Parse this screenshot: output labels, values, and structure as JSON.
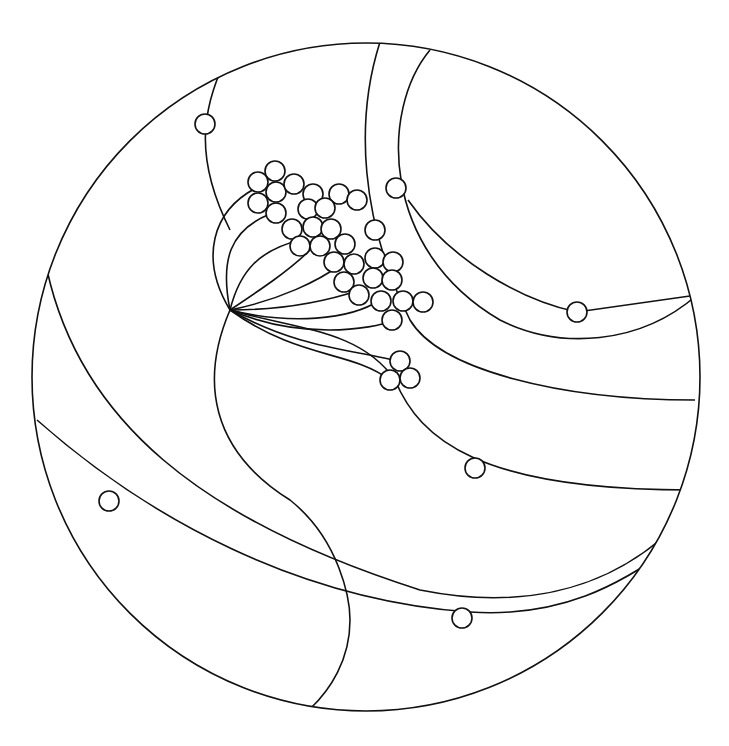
{
  "diagram": {
    "type": "hyperbolic-tree-disk",
    "disk": {
      "cx": 366,
      "cy": 377,
      "r": 334
    },
    "node_radius": 10,
    "stroke_color": "#111111",
    "background": "#ffffff",
    "nodes": [
      [
        205,
        124
      ],
      [
        396,
        188
      ],
      [
        577,
        312
      ],
      [
        475,
        468
      ],
      [
        109,
        501
      ],
      [
        462,
        618
      ],
      [
        275,
        171
      ],
      [
        258,
        182
      ],
      [
        276,
        192
      ],
      [
        294,
        184
      ],
      [
        258,
        203
      ],
      [
        276,
        213
      ],
      [
        313,
        194
      ],
      [
        339,
        194
      ],
      [
        357,
        200
      ],
      [
        308,
        209
      ],
      [
        325,
        208
      ],
      [
        292,
        229
      ],
      [
        313,
        227
      ],
      [
        331,
        229
      ],
      [
        345,
        244
      ],
      [
        375,
        230
      ],
      [
        300,
        246
      ],
      [
        320,
        246
      ],
      [
        334,
        262
      ],
      [
        354,
        264
      ],
      [
        375,
        258
      ],
      [
        393,
        262
      ],
      [
        373,
        278
      ],
      [
        392,
        280
      ],
      [
        344,
        282
      ],
      [
        359,
        295
      ],
      [
        381,
        301
      ],
      [
        403,
        301
      ],
      [
        423,
        302
      ],
      [
        392,
        320
      ],
      [
        400,
        361
      ],
      [
        390,
        380
      ],
      [
        410,
        378
      ]
    ],
    "curves": [
      "M228,55 C200,110 195,160 230,230",
      "M380,42 C355,120 360,220 410,320 C440,370 560,400 695,400",
      "M430,50 C380,110 380,250 500,320 C560,350 640,345 697,295",
      "M230,310 C200,380 210,450 290,500 C340,540 350,600 350,620 C350,660 330,690 310,709",
      "M47,270 C80,420 200,520 420,590 C520,610 600,590 660,540",
      "M37,420 C150,520 300,600 470,612 C560,618 620,585 672,547",
      "M230,310 C300,330 360,330 395,380 C420,440 480,490 690,490",
      "M230,310 C200,260 210,210 260,186",
      "M230,310 C220,260 230,230 270,214",
      "M230,310 C240,270 260,250 300,240",
      "M230,310 C260,290 290,270 310,250",
      "M230,310 C280,300 320,280 340,265",
      "M230,310 C290,310 330,300 360,290",
      "M230,310 C290,325 350,320 380,300",
      "M230,310 C300,340 370,330 395,320",
      "M230,310 C300,350 360,350 400,362",
      "M230,310 C300,360 350,350 390,380",
      "M408,200 C450,260 520,300 577,312 L697,295"
    ]
  }
}
